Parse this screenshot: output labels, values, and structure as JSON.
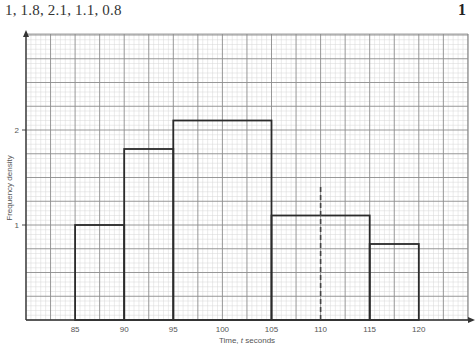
{
  "header": {
    "values_text": "1, 1.8, 2.1, 1.1, 0.8",
    "question_number": "1"
  },
  "chart_data": {
    "type": "histogram",
    "title": "",
    "xlabel": "Time, t seconds",
    "ylabel": "Frequency density",
    "xlim": [
      80,
      124
    ],
    "ylim": [
      0,
      3
    ],
    "grid": true,
    "x_ticks": [
      85,
      90,
      95,
      100,
      105,
      110,
      115,
      120
    ],
    "y_ticks": [
      1,
      2
    ],
    "bins": [
      {
        "from": 85,
        "to": 90,
        "frequency_density": 1.0
      },
      {
        "from": 90,
        "to": 95,
        "frequency_density": 1.8
      },
      {
        "from": 95,
        "to": 105,
        "frequency_density": 2.1
      },
      {
        "from": 105,
        "to": 115,
        "frequency_density": 1.1
      },
      {
        "from": 115,
        "to": 120,
        "frequency_density": 0.8
      }
    ],
    "annotations": [
      {
        "type": "dashed-vertical-line",
        "x": 110,
        "y_top": 1.4
      }
    ],
    "colors": {
      "bar_outline": "#2b2b2b",
      "major_grid": "#8c8c8c",
      "minor_grid": "#d6d6d6",
      "axis": "#333333",
      "dashed_line": "#444444"
    }
  }
}
